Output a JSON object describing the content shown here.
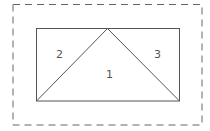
{
  "diagram": {
    "regions": [
      {
        "id": "1",
        "label": "1",
        "position": "center-triangle"
      },
      {
        "id": "2",
        "label": "2",
        "position": "left-triangle"
      },
      {
        "id": "3",
        "label": "3",
        "position": "right-triangle"
      }
    ],
    "colors": {
      "line": "#555555",
      "dashed": "#666666",
      "background": "#ffffff"
    }
  }
}
